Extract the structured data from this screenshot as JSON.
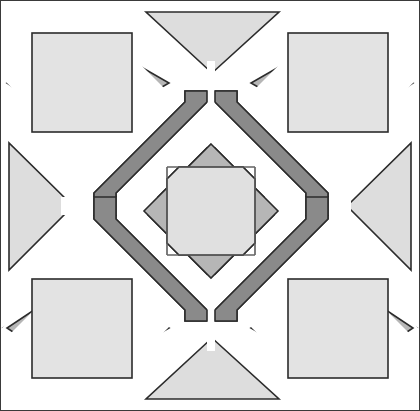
{
  "figure": {
    "canvas": {
      "width": 420,
      "height": 411,
      "background": "#ffffff"
    },
    "border": {
      "color": "#3a3a3a",
      "width": 1
    }
  },
  "palette": {
    "background": "#ffffff",
    "outline": "#2b2b2b",
    "light_gray": "#e3e3e3",
    "pale_gray": "#dddddd",
    "mid_gray": "#b6b6b6",
    "medium_gray": "#aaaaaa",
    "dark_gray": "#858585",
    "bar_dark": "#8a8a8a",
    "center_fill": "#e0e0e0"
  },
  "shapes": {
    "corner_diamonds": [
      {
        "name": "corner-diamond-top-left",
        "fill": "#b6b6b6",
        "points": "81,32 168,82 81,132 2,82"
      },
      {
        "name": "corner-diamond-top-right",
        "fill": "#b6b6b6",
        "points": "337,32 416,82 337,132 250,82"
      },
      {
        "name": "corner-diamond-bottom-left",
        "fill": "#b6b6b6",
        "points": "81,277 168,327 81,377 2,327"
      },
      {
        "name": "corner-diamond-bottom-right",
        "fill": "#b6b6b6",
        "points": "337,277 416,327 337,377 250,327"
      }
    ],
    "corner_squares": [
      {
        "name": "corner-square-top-left",
        "fill": "#e3e3e3",
        "x": 31,
        "y": 32,
        "w": 100,
        "h": 99
      },
      {
        "name": "corner-square-top-right",
        "fill": "#e3e3e3",
        "x": 287,
        "y": 32,
        "w": 100,
        "h": 99
      },
      {
        "name": "corner-square-bottom-left",
        "fill": "#e3e3e3",
        "x": 31,
        "y": 278,
        "w": 100,
        "h": 99
      },
      {
        "name": "corner-square-bottom-right",
        "fill": "#e3e3e3",
        "x": 287,
        "y": 278,
        "w": 100,
        "h": 99
      }
    ],
    "edge_triangles": [
      {
        "name": "edge-triangle-top",
        "fill": "#dddddd",
        "points": "145,11 278,11 211,72"
      },
      {
        "name": "edge-triangle-bottom",
        "fill": "#dddddd",
        "points": "145,398 278,398 211,337"
      },
      {
        "name": "edge-triangle-left",
        "fill": "#dddddd",
        "points": "8,142 8,269 72,205"
      },
      {
        "name": "edge-triangle-right",
        "fill": "#dddddd",
        "points": "410,142 410,269 346,205"
      }
    ],
    "diagonal_bars": [
      {
        "name": "diagonal-bar-top-left",
        "fill": "#8a8a8a",
        "points": "183,92 206,92 116,182 116,205 93,205 93,182 173,102"
      },
      {
        "name": "diagonal-bar-top-right",
        "fill": "#8a8a8a",
        "points": "236,92 213,92 303,182 303,205 326,205 326,182 246,102"
      },
      {
        "name": "diagonal-bar-bottom-left",
        "fill": "#8a8a8a",
        "points": "183,318 206,318 116,228 116,205 93,205 93,228 173,308"
      },
      {
        "name": "diagonal-bar-bottom-right",
        "fill": "#8a8a8a",
        "points": "236,318 213,318 303,228 303,205 326,205 326,228 246,308"
      }
    ],
    "center": {
      "diamond": {
        "name": "center-diamond",
        "fill": "#b6b6b6",
        "points": "210,143 277,210 210,277 143,210"
      },
      "inner_square": {
        "name": "center-inner-square",
        "fill": "#e0e0e0",
        "x": 166,
        "y": 166,
        "w": 88,
        "h": 88
      },
      "octagon": {
        "name": "center-octagon",
        "fill": "#e0e0e0",
        "points": "178,166 242,166 254,178 254,242 242,254 178,254 166,242 166,178"
      }
    }
  },
  "labels": {
    "figure_role": "decorative-geometric-figure"
  }
}
